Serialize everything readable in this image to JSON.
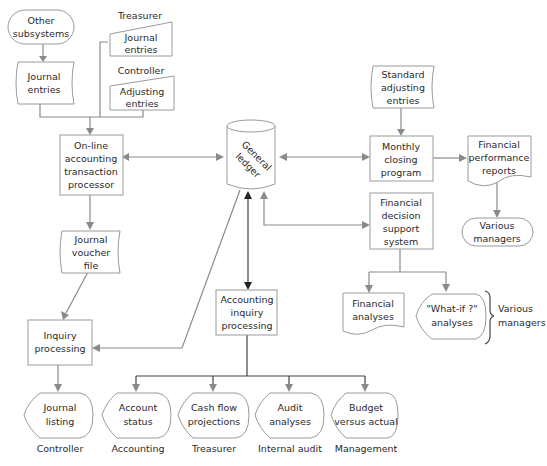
{
  "diagram": {
    "nodes": {
      "other_subsystems": {
        "lines": [
          "Other",
          "subsystems"
        ],
        "shape": "terminal"
      },
      "journal_entries_doc": {
        "lines": [
          "Journal",
          "entries"
        ],
        "shape": "document"
      },
      "treasurer_label": "Treasurer",
      "treasurer_journal_entries": {
        "lines": [
          "Journal",
          "entries"
        ],
        "shape": "manual-input"
      },
      "controller_label": "Controller",
      "controller_adjusting_entries": {
        "lines": [
          "Adjusting",
          "entries"
        ],
        "shape": "manual-input"
      },
      "online_processor": {
        "lines": [
          "On-line",
          "accounting",
          "transaction",
          "processor"
        ],
        "shape": "process"
      },
      "general_ledger": {
        "lines": [
          "General",
          "ledger"
        ],
        "shape": "database"
      },
      "standard_adjusting_entries": {
        "lines": [
          "Standard",
          "adjusting",
          "entries"
        ],
        "shape": "document"
      },
      "monthly_closing": {
        "lines": [
          "Monthly",
          "closing",
          "program"
        ],
        "shape": "process"
      },
      "financial_performance_reports": {
        "lines": [
          "Financial",
          "performance",
          "reports"
        ],
        "shape": "document"
      },
      "various_managers_top": {
        "lines": [
          "Various",
          "managers"
        ],
        "shape": "terminal"
      },
      "financial_dss": {
        "lines": [
          "Financial",
          "decision",
          "support",
          "system"
        ],
        "shape": "process"
      },
      "journal_voucher_file": {
        "lines": [
          "Journal",
          "voucher",
          "file"
        ],
        "shape": "document"
      },
      "inquiry_processing": {
        "lines": [
          "Inquiry",
          "processing"
        ],
        "shape": "process"
      },
      "accounting_inquiry_processing": {
        "lines": [
          "Accounting",
          "inquiry",
          "processing"
        ],
        "shape": "process"
      },
      "financial_analyses": {
        "lines": [
          "Financial",
          "analyses"
        ],
        "shape": "document"
      },
      "what_if_analyses": {
        "lines": [
          "\"What-if ?\"",
          "analyses"
        ],
        "shape": "display"
      },
      "various_managers_brace": {
        "lines": [
          "Various",
          "managers"
        ]
      }
    },
    "outputs": [
      {
        "lines": [
          "Journal",
          "listing"
        ],
        "user": "Controller"
      },
      {
        "lines": [
          "Account",
          "status"
        ],
        "user": "Accounting"
      },
      {
        "lines": [
          "Cash flow",
          "projections"
        ],
        "user": "Treasurer"
      },
      {
        "lines": [
          "Audit",
          "analyses"
        ],
        "user": "Internal audit"
      },
      {
        "lines": [
          "Budget",
          "versus actual"
        ],
        "user": "Management"
      }
    ],
    "colors": {
      "line": "#8a8a8a",
      "line_dark": "#222222",
      "shape_stroke": "#9a9a9a",
      "text": "#2a2a2a"
    }
  }
}
